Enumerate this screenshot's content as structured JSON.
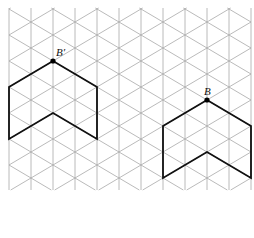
{
  "diagram": {
    "type": "isometric-grid-transformation",
    "grid": {
      "vertical_line_x": [
        9,
        31,
        53,
        75,
        97,
        119,
        141,
        163,
        185,
        207,
        229,
        251
      ],
      "column_spacing": 22,
      "row_spacing": 26,
      "top": 8,
      "bottom": 190,
      "line_color": "#a8a8a8"
    },
    "shapes": [
      {
        "name": "image-shape",
        "label": "B′",
        "vertex_point": [
          53,
          61
        ],
        "outline": [
          [
            53,
            61
          ],
          [
            97,
            87
          ],
          [
            97,
            139
          ],
          [
            53,
            113
          ],
          [
            9,
            139
          ],
          [
            9,
            87
          ],
          [
            53,
            61
          ]
        ],
        "label_pos": [
          56,
          56
        ]
      },
      {
        "name": "original-shape",
        "label": "B",
        "vertex_point": [
          207,
          100
        ],
        "outline": [
          [
            207,
            100
          ],
          [
            251,
            126
          ],
          [
            251,
            178
          ],
          [
            207,
            152
          ],
          [
            163,
            178
          ],
          [
            163,
            126
          ],
          [
            207,
            100
          ]
        ],
        "label_pos": [
          204,
          95
        ]
      }
    ],
    "stroke_color": "#111111"
  }
}
